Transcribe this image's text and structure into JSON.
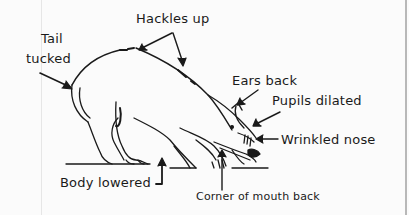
{
  "diagram": {
    "labels": {
      "tail": [
        "Tail",
        "tucked"
      ],
      "hackles": "Hackles up",
      "ears": "Ears back",
      "pupils": "Pupils dilated",
      "nose": "Wrinkled nose",
      "body": "Body lowered",
      "mouth": "Corner of mouth back"
    },
    "colors": {
      "ink": "#1a1a1a",
      "paper": "#fbfbfb"
    }
  }
}
